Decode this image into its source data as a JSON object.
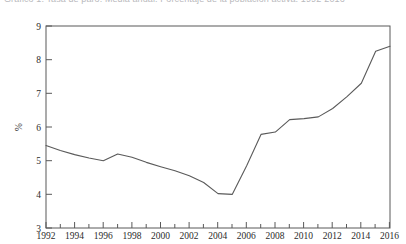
{
  "figure": {
    "title_truncated": "Gráfico 1. Tasa de paro. Media anual. Porcentaje de la población activa. 1992-2016",
    "background_color": "#ffffff",
    "line_color": "#5a5a5a",
    "axis_color": "#595959"
  },
  "chart_data": {
    "type": "line",
    "title": "",
    "xlabel": "",
    "ylabel": "%",
    "xlim": [
      1992,
      2016
    ],
    "ylim": [
      3,
      9
    ],
    "yticks": [
      3,
      4,
      5,
      6,
      7,
      8,
      9
    ],
    "ytick_labels": [
      "3",
      "4",
      "5",
      "6",
      "7",
      "8",
      "9"
    ],
    "xticks": [
      1992,
      1994,
      1996,
      1998,
      2000,
      2002,
      2004,
      2006,
      2008,
      2010,
      2012,
      2014,
      2016
    ],
    "xtick_labels": [
      "1992",
      "1994",
      "1996",
      "1998",
      "2000",
      "2002",
      "2004",
      "2006",
      "2008",
      "2010",
      "2012",
      "2014",
      "2016"
    ],
    "x_minor_ticks": [
      1993,
      1995,
      1997,
      1999,
      2001,
      2003,
      2005,
      2007,
      2009,
      2011,
      2013,
      2015
    ],
    "grid": false,
    "legend": null,
    "series": [
      {
        "name": "%",
        "x": [
          1992,
          1993,
          1994,
          1995,
          1996,
          1997,
          1998,
          1999,
          2000,
          2001,
          2002,
          2003,
          2004,
          2005,
          2006,
          2007,
          2008,
          2009,
          2010,
          2011,
          2012,
          2013,
          2014,
          2015,
          2016
        ],
        "values": [
          5.45,
          5.3,
          5.18,
          5.08,
          5.0,
          5.2,
          5.1,
          4.95,
          4.82,
          4.7,
          4.55,
          4.35,
          4.02,
          4.0,
          4.85,
          5.78,
          5.85,
          6.22,
          6.25,
          6.3,
          6.55,
          6.9,
          7.3,
          8.25,
          8.4
        ]
      }
    ]
  }
}
